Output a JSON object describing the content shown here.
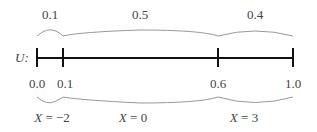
{
  "variable_label": "U:",
  "segments_top": [
    {
      "label": "0.1",
      "x": 50
    },
    {
      "label": "0.5",
      "x": 140
    },
    {
      "label": "0.4",
      "x": 255
    }
  ],
  "ticks": [
    {
      "label": "0.0",
      "x": 37
    },
    {
      "label": "0.1",
      "x": 63
    },
    {
      "label": "0.6",
      "x": 218
    },
    {
      "label": "1.0",
      "x": 293
    }
  ],
  "segments_bottom": [
    {
      "label_var": "X",
      "label_eq": " = −2",
      "x": 50
    },
    {
      "label_var": "X",
      "label_eq": " = 0",
      "x": 140
    },
    {
      "label_var": "X",
      "label_eq": " = 3",
      "x": 255
    }
  ]
}
